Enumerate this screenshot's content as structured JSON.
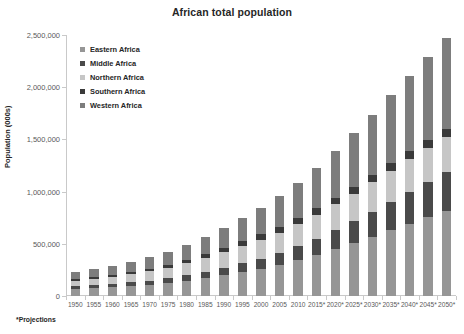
{
  "chart_data": {
    "type": "bar",
    "variant": "stacked-vertical",
    "title": "African total population",
    "xlabel": "",
    "ylabel": "Population (000s)",
    "ylim": [
      0,
      2500000
    ],
    "ytick_values": [
      0,
      500000,
      1000000,
      1500000,
      2000000,
      2500000
    ],
    "ytick_labels": [
      "0",
      "500,000",
      "1,000,000",
      "1,500,000",
      "2,000,000",
      "2,500,000"
    ],
    "grid": false,
    "legend_position": "top-left inside plot",
    "footnote": "*Projections",
    "categories": [
      "1950",
      "1955",
      "1960",
      "1965",
      "1970",
      "1975",
      "1980",
      "1985",
      "1990",
      "1995",
      "2000",
      "2005",
      "2010",
      "2015*",
      "2020*",
      "2025*",
      "2030*",
      "2035*",
      "2040*",
      "2045*",
      "2050*"
    ],
    "series": [
      {
        "name": "Eastern Africa",
        "color": "#969696",
        "values": [
          66000,
          74000,
          83000,
          94000,
          108000,
          124000,
          144000,
          170000,
          199000,
          230000,
          262000,
          299000,
          344000,
          394000,
          449000,
          508000,
          569000,
          631000,
          693000,
          753000,
          810000
        ]
      },
      {
        "name": "Middle Africa",
        "color": "#4a4a4a",
        "values": [
          26000,
          29000,
          32000,
          36000,
          40000,
          46000,
          53000,
          62000,
          72000,
          84000,
          97000,
          113000,
          132000,
          154000,
          179000,
          207000,
          238000,
          271000,
          306000,
          342000,
          379000
        ]
      },
      {
        "name": "Northern Africa",
        "color": "#c6c6c6",
        "values": [
          53000,
          60000,
          68000,
          78000,
          89000,
          102000,
          117000,
          133000,
          150000,
          166000,
          181000,
          196000,
          213000,
          231000,
          249000,
          266000,
          282000,
          296000,
          309000,
          320000,
          330000
        ]
      },
      {
        "name": "Southern Africa",
        "color": "#3a3a3a",
        "values": [
          15000,
          17000,
          19000,
          22000,
          25000,
          29000,
          33000,
          38000,
          43000,
          48000,
          51000,
          54000,
          57000,
          60000,
          64000,
          68000,
          71000,
          74000,
          77000,
          79000,
          81000
        ]
      },
      {
        "name": "Western Africa",
        "color": "#7d7d7d",
        "values": [
          68000,
          76000,
          85000,
          96000,
          109000,
          125000,
          144000,
          166000,
          192000,
          221000,
          254000,
          293000,
          339000,
          391000,
          448000,
          511000,
          578000,
          649000,
          722000,
          797000,
          872000
        ]
      }
    ],
    "totals": [
      228000,
      256000,
      287000,
      326000,
      371000,
      426000,
      491000,
      569000,
      656000,
      749000,
      845000,
      955000,
      1085000,
      1230000,
      1389000,
      1560000,
      1738000,
      1921000,
      2107000,
      2291000,
      2472000
    ]
  }
}
